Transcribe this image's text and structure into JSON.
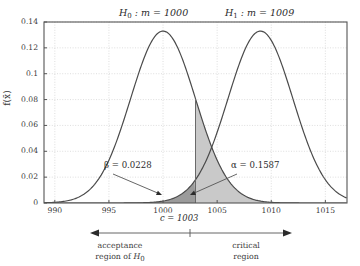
{
  "chart_data": {
    "type": "line",
    "title": "",
    "xlabel": "",
    "ylabel": "f(x̄)",
    "xlim": [
      989,
      1017
    ],
    "ylim": [
      0,
      0.14
    ],
    "grid": true,
    "legend_position": "above-plot",
    "xticks": [
      "990",
      "995",
      "1000",
      "1005",
      "1010",
      "1015"
    ],
    "xtick_values": [
      990,
      995,
      1000,
      1005,
      1010,
      1015
    ],
    "yticks": [
      "0",
      "0.02",
      "0.04",
      "0.06",
      "0.08",
      "0.1",
      "0.12",
      "0.14"
    ],
    "ytick_values": [
      0,
      0.02,
      0.04,
      0.06,
      0.08,
      0.1,
      0.12,
      0.14
    ],
    "series": [
      {
        "name": "H0",
        "label": "H₀ : m = 1000",
        "distribution": "normal",
        "mean": 1000,
        "sigma": 3,
        "peak": 0.133,
        "color": "#4a4a4a"
      },
      {
        "name": "H1",
        "label": "H₁ : m = 1009",
        "distribution": "normal",
        "mean": 1009,
        "sigma": 3,
        "peak": 0.133,
        "color": "#4a4a4a"
      }
    ],
    "critical_value": 1003,
    "annotations": [
      {
        "name": "beta",
        "text": "β = 0.0228",
        "value": 0.0228,
        "region": "under H1 left of c"
      },
      {
        "name": "alpha",
        "text": "α = 0.1587",
        "value": 0.1587,
        "region": "under H0 right of c"
      },
      {
        "name": "critical-value",
        "text": "c = 1003"
      }
    ],
    "shaded_regions": [
      {
        "name": "alpha-region",
        "color": "#c9c9c9",
        "from": 1003,
        "to": 1017,
        "curve": "H0"
      },
      {
        "name": "beta-region",
        "color": "#9b9b9b",
        "from": 989,
        "to": 1003,
        "curve": "H1"
      }
    ]
  },
  "labels": {
    "h0": {
      "symbol": "H",
      "sub": "0",
      "rest": " :  m = 1000"
    },
    "h1": {
      "symbol": "H",
      "sub": "1",
      "rest": " :  m = 1009"
    },
    "ylabel": "f(x̄)",
    "critical_value": "c = 1003",
    "beta": "β = 0.0228",
    "alpha": "α = 0.1587",
    "acceptance_line1": "acceptance",
    "acceptance_line2_pre": "region of ",
    "acceptance_line2_sym": "H",
    "acceptance_line2_sub": "0",
    "critical_line1": "critical",
    "critical_line2": "region"
  },
  "colors": {
    "curve": "#4a4a4a",
    "alpha_fill": "#c9c9c9",
    "beta_fill": "#9b9b9b",
    "grid": "#c8c8c8",
    "frame": "#555555",
    "text": "#3a3a3a"
  }
}
